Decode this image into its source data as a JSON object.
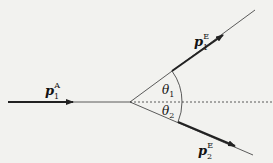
{
  "diagram": {
    "type": "momentum-scattering",
    "labels": {
      "incoming": {
        "symbol": "p",
        "sub": "1",
        "sup": "A"
      },
      "outgoing_1": {
        "symbol": "p",
        "sub": "1",
        "sup": "E"
      },
      "outgoing_2": {
        "symbol": "p",
        "sub": "2",
        "sup": "E"
      },
      "angle_1": {
        "symbol": "θ",
        "sub": "1"
      },
      "angle_2": {
        "symbol": "θ",
        "sub": "2"
      }
    },
    "colors": {
      "line": "#222222",
      "background": "#f2f2ef"
    }
  }
}
